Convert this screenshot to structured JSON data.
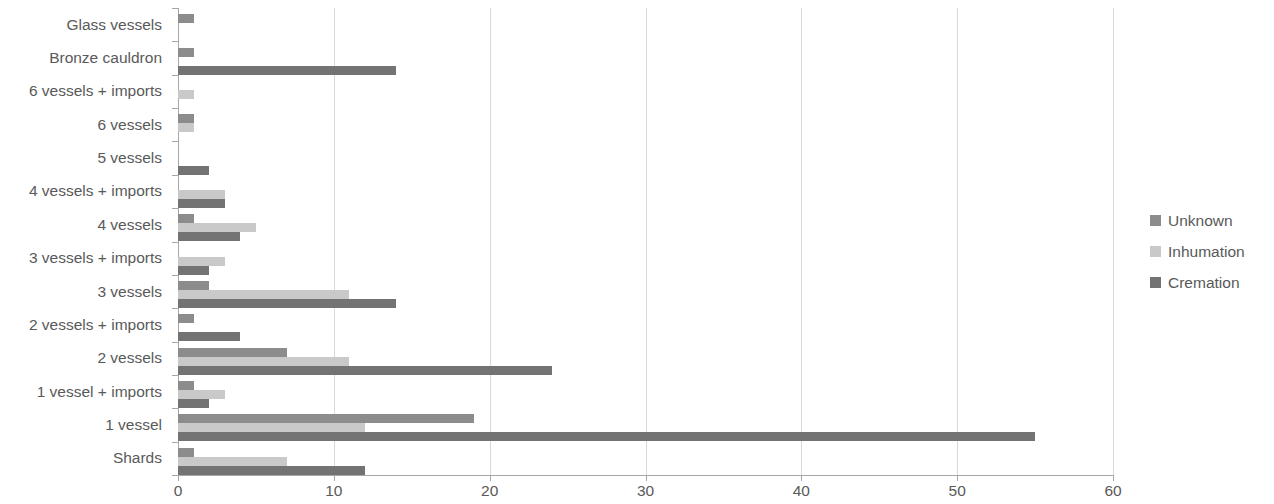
{
  "chart_data": {
    "type": "bar",
    "orientation": "horizontal",
    "title": "",
    "xlabel": "",
    "ylabel": "",
    "xlim": [
      0,
      60
    ],
    "xticks": [
      0,
      10,
      20,
      30,
      40,
      50,
      60
    ],
    "grid": true,
    "legend_position": "right",
    "categories": [
      "Glass vessels",
      "Bronze cauldron",
      "6 vessels + imports",
      "6 vessels",
      "5 vessels",
      "4 vessels + imports",
      "4 vessels",
      "3 vessels + imports",
      "3 vessels",
      "2 vessels + imports",
      "2 vessels",
      "1 vessel + imports",
      "1 vessel",
      "Shards"
    ],
    "series": [
      {
        "name": "Unknown",
        "color": "#8c8c8c",
        "values": [
          1,
          1,
          0,
          1,
          0,
          0,
          1,
          0,
          2,
          1,
          7,
          1,
          19,
          1
        ]
      },
      {
        "name": "Inhumation",
        "color": "#c9c9c9",
        "values": [
          0,
          0,
          1,
          1,
          0,
          3,
          5,
          3,
          11,
          0,
          11,
          3,
          12,
          7
        ]
      },
      {
        "name": "Cremation",
        "color": "#737373",
        "values": [
          0,
          14,
          0,
          0,
          2,
          3,
          4,
          2,
          14,
          4,
          24,
          2,
          55,
          12
        ]
      }
    ]
  },
  "legend": {
    "items": [
      {
        "label": "Unknown",
        "color": "#8c8c8c"
      },
      {
        "label": "Inhumation",
        "color": "#c9c9c9"
      },
      {
        "label": "Cremation",
        "color": "#737373"
      }
    ]
  }
}
